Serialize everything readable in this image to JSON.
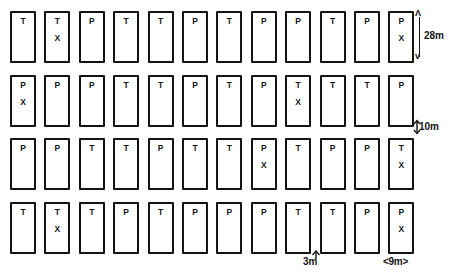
{
  "diagram": {
    "grid": {
      "rows": 4,
      "columns": 12,
      "origin_x": 10,
      "origin_y": 11,
      "cell_width": 26,
      "cell_height": 52,
      "column_pitch": 34.4,
      "row_pitch": 63.7
    },
    "marker_symbol": "X",
    "bay_types": {
      "T": "T",
      "P": "P"
    },
    "rows": [
      {
        "index": 1,
        "cells": [
          {
            "label": "T",
            "mark": ""
          },
          {
            "label": "T",
            "mark": "X"
          },
          {
            "label": "P",
            "mark": ""
          },
          {
            "label": "T",
            "mark": ""
          },
          {
            "label": "T",
            "mark": ""
          },
          {
            "label": "P",
            "mark": ""
          },
          {
            "label": "T",
            "mark": ""
          },
          {
            "label": "P",
            "mark": ""
          },
          {
            "label": "P",
            "mark": ""
          },
          {
            "label": "T",
            "mark": ""
          },
          {
            "label": "P",
            "mark": ""
          },
          {
            "label": "P",
            "mark": "X"
          }
        ]
      },
      {
        "index": 2,
        "cells": [
          {
            "label": "P",
            "mark": "X"
          },
          {
            "label": "P",
            "mark": ""
          },
          {
            "label": "P",
            "mark": ""
          },
          {
            "label": "T",
            "mark": ""
          },
          {
            "label": "T",
            "mark": ""
          },
          {
            "label": "P",
            "mark": ""
          },
          {
            "label": "T",
            "mark": ""
          },
          {
            "label": "P",
            "mark": ""
          },
          {
            "label": "T",
            "mark": "X"
          },
          {
            "label": "T",
            "mark": ""
          },
          {
            "label": "T",
            "mark": ""
          },
          {
            "label": "P",
            "mark": ""
          }
        ]
      },
      {
        "index": 3,
        "cells": [
          {
            "label": "P",
            "mark": ""
          },
          {
            "label": "P",
            "mark": ""
          },
          {
            "label": "T",
            "mark": ""
          },
          {
            "label": "T",
            "mark": ""
          },
          {
            "label": "P",
            "mark": ""
          },
          {
            "label": "T",
            "mark": ""
          },
          {
            "label": "T",
            "mark": ""
          },
          {
            "label": "P",
            "mark": "X"
          },
          {
            "label": "T",
            "mark": ""
          },
          {
            "label": "P",
            "mark": ""
          },
          {
            "label": "P",
            "mark": ""
          },
          {
            "label": "T",
            "mark": "X"
          }
        ]
      },
      {
        "index": 4,
        "cells": [
          {
            "label": "T",
            "mark": ""
          },
          {
            "label": "T",
            "mark": "X"
          },
          {
            "label": "T",
            "mark": ""
          },
          {
            "label": "P",
            "mark": ""
          },
          {
            "label": "T",
            "mark": ""
          },
          {
            "label": "P",
            "mark": ""
          },
          {
            "label": "P",
            "mark": ""
          },
          {
            "label": "P",
            "mark": ""
          },
          {
            "label": "T",
            "mark": ""
          },
          {
            "label": "T",
            "mark": ""
          },
          {
            "label": "P",
            "mark": ""
          },
          {
            "label": "P",
            "mark": "X"
          }
        ]
      }
    ],
    "dimensions": {
      "bay_depth": "28m",
      "row_gap": "10m",
      "column_gap": "3m",
      "bay_width": "<9m>"
    },
    "colors": {
      "stroke": "#141414",
      "fill": "#ffffff"
    }
  }
}
